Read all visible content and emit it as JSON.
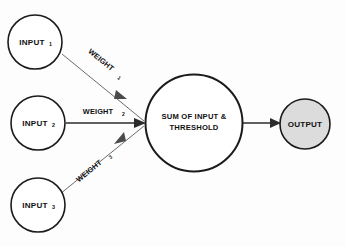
{
  "diagram": {
    "type": "perceptron-neuron-schematic",
    "background_color": "#fdfdfd",
    "stroke_color": "#1b1b1b",
    "fill_color": "#ffffff",
    "accent_fill_color": "#dcdcdc",
    "nodes": {
      "input1": {
        "label": "INPUT",
        "subscript": "1"
      },
      "input2": {
        "label": "INPUT",
        "subscript": "2"
      },
      "input3": {
        "label": "INPUT",
        "subscript": "3"
      },
      "summation": {
        "line1": "SUM OF INPUT &",
        "line2": "THRESHOLD"
      },
      "output": {
        "label": "OUTPUT"
      }
    },
    "edges": {
      "weight1": {
        "label": "WEIGHT",
        "subscript": "1"
      },
      "weight2": {
        "label": "WEIGHT",
        "subscript": "2"
      },
      "weight3": {
        "label": "WEIGHT",
        "subscript": "3"
      },
      "output_edge": {
        "label": ""
      }
    }
  }
}
